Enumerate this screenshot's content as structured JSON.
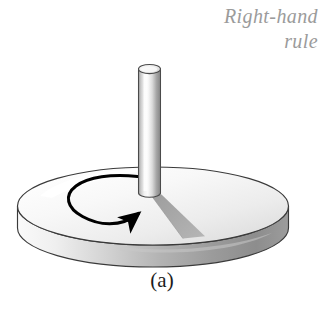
{
  "figure": {
    "caption": "(a)",
    "annotation": {
      "line1": "Right-hand",
      "line2": "rule",
      "color": "#9b9b9b"
    },
    "alt_description": "A flat circular disk shown in perspective with a vertical rod through its center and a curved arrow on the disk surface indicating counterclockwise rotation",
    "elements": {
      "disk_label": "rotating disk",
      "rod_label": "vertical axle rod",
      "arrow_label": "counterclockwise rotation arrow",
      "shadow_label": "rod shadow on disk"
    },
    "colors": {
      "background": "#ffffff",
      "disk_top": "#f4f4f4",
      "disk_rim_light": "#e3e3e3",
      "disk_rim_dark": "#8f8f8f",
      "rod_light": "#f0f0f0",
      "rod_dark": "#8a8a8a",
      "shadow": "#a8a8a8",
      "outline": "#2b2b2b",
      "arrow": "#000000",
      "caption_text": "#1c1c1c"
    }
  }
}
